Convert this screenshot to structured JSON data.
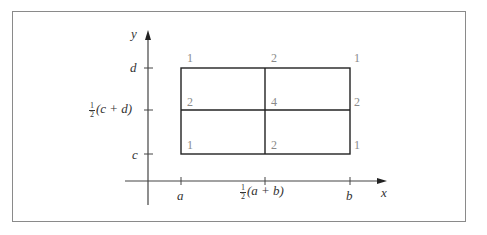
{
  "diagram": {
    "axes": {
      "x_label": "x",
      "y_label": "y"
    },
    "x_ticks": [
      {
        "label": "a"
      },
      {
        "frac_num": "1",
        "frac_den": "2",
        "label_rest": "(a + b)"
      },
      {
        "label": "b"
      }
    ],
    "y_ticks": [
      {
        "label": "d"
      },
      {
        "frac_num": "1",
        "frac_den": "2",
        "label_rest": "(c + d)"
      },
      {
        "label": "c"
      }
    ],
    "weights": {
      "top_left": "1",
      "top_mid": "2",
      "top_right": "1",
      "mid_left": "2",
      "center": "4",
      "mid_right": "2",
      "bottom_left": "1",
      "bottom_mid": "2",
      "bottom_right": "1"
    },
    "colors": {
      "line": "#222222",
      "axis": "#444444",
      "weight_text": "#8a8a8a",
      "frame": "#8a8a8a"
    }
  }
}
